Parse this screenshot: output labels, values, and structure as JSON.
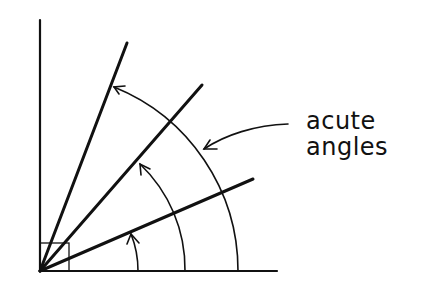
{
  "diagram": {
    "label_lines": [
      "acute",
      "angles"
    ],
    "stroke_color": "#111111",
    "background": "#ffffff",
    "elements": {
      "axes": [
        "vertical-axis",
        "horizontal-axis"
      ],
      "right_angle_marker": true,
      "rays": 3,
      "arcs": 3,
      "pointer_arrow": true
    }
  }
}
